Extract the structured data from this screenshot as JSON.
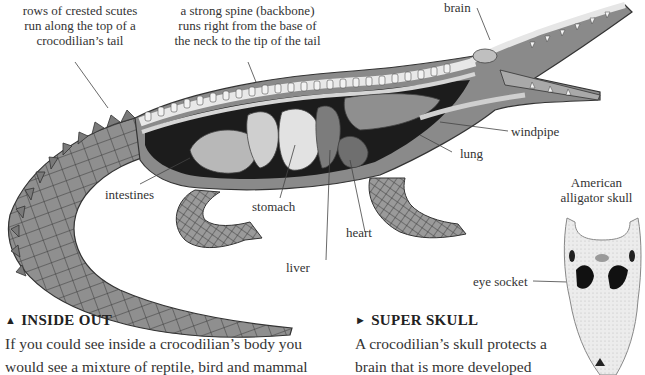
{
  "labels": {
    "scutes": [
      "rows of crested scutes",
      "run along the top of a",
      "crocodilian’s tail"
    ],
    "spine": [
      "a strong spine (backbone)",
      "runs right from the base of",
      "the neck to the tip of the tail"
    ],
    "brain": "brain",
    "windpipe": "windpipe",
    "lung": "lung",
    "intestines": "intestines",
    "stomach": "stomach",
    "heart": "heart",
    "liver": "liver",
    "skull_caption": [
      "American",
      "alligator skull"
    ],
    "eye_socket": "eye socket"
  },
  "sections": {
    "inside_out": {
      "marker": "▲",
      "title": "INSIDE OUT",
      "lines": [
        "If you could see inside a crocodilian’s body you",
        "would see a mixture of reptile, bird and mammal"
      ]
    },
    "super_skull": {
      "marker": "►",
      "title": "SUPER SKULL",
      "lines": [
        "A crocodilian’s skull protects a",
        "brain that is more developed"
      ]
    }
  },
  "colors": {
    "text": "#333333",
    "leader": "#444444",
    "skin_dark": "#5a5a5a",
    "skin_mid": "#8c8c8c",
    "skin_light": "#bdbdbd",
    "bone": "#efefef",
    "organ": "#a8a8a8",
    "cavity": "#1c1c1c"
  }
}
